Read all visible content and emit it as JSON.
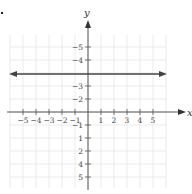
{
  "chart_data": {
    "type": "line",
    "title": "",
    "xlabel": "x",
    "ylabel": "y",
    "xlim": [
      -6,
      6
    ],
    "ylim": [
      -6,
      6
    ],
    "grid": true,
    "x_ticks": [
      -5,
      -4,
      -3,
      -2,
      -1,
      1,
      2,
      3,
      4,
      5
    ],
    "y_ticks": [
      -5,
      -4,
      -3,
      -2,
      -1,
      1,
      2,
      4,
      5
    ],
    "series": [
      {
        "name": "y = 3",
        "equation": "y = 3",
        "x": [
          -6,
          6
        ],
        "y": [
          3,
          3
        ],
        "arrows": "both"
      }
    ]
  },
  "labels": {
    "x_axis": "x",
    "y_axis": "y",
    "x_ticks": [
      "−5",
      "−4",
      "−3",
      "−2",
      "−1",
      "1",
      "2",
      "3",
      "4",
      "5"
    ],
    "y_ticks": [
      "5",
      "4",
      "2",
      "1",
      "−1",
      "−2",
      "−3",
      "−4",
      "−5"
    ]
  },
  "colors": {
    "grid": "#e6e6e6",
    "axis": "#555555",
    "line": "#444444"
  }
}
